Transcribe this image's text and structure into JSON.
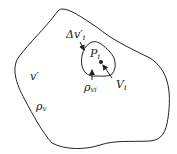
{
  "labels": {
    "delta_v": "Δv′",
    "delta_v_sub": "i",
    "p": "P",
    "p_sub": "i",
    "V": "V",
    "V_sub": "i",
    "rho_vi": "ρ",
    "rho_vi_sub": "vi",
    "v_prime": "v′",
    "rho_v": "ρ",
    "rho_v_sub": "v"
  },
  "colors": {
    "stroke": "#222222",
    "background": "#ffffff"
  }
}
